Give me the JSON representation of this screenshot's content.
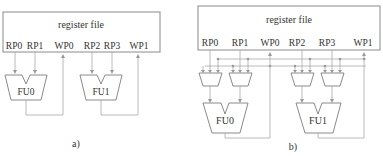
{
  "panel_a": {
    "caption": "a)",
    "register_file": {
      "title": "register file",
      "ports": [
        "RP0",
        "RP1",
        "WP0",
        "RP2",
        "RP3",
        "WP1"
      ]
    },
    "functional_units": [
      "FU0",
      "FU1"
    ]
  },
  "panel_b": {
    "caption": "b)",
    "register_file": {
      "title": "register file",
      "ports": [
        "RP0",
        "RP1",
        "WP0",
        "RP2",
        "RP3",
        "WP1"
      ]
    },
    "functional_units": [
      "FU0",
      "FU1"
    ],
    "bypass_muxes": 4
  },
  "colors": {
    "line": "#a8a8a8",
    "outline": "#8a8a8a",
    "text": "#333333",
    "background": "#ffffff"
  }
}
